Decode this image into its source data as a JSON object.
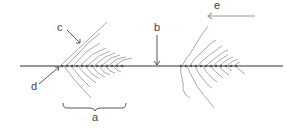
{
  "diagram": {
    "labels": {
      "a": "a",
      "b": "b",
      "c": "c",
      "d": "d",
      "e": "e"
    },
    "colors": {
      "axis": "#333333",
      "waves": "#a0a0a0",
      "arrows": "#444444",
      "direction_arrow": "#999999",
      "background": "#ffffff"
    },
    "components": [
      {
        "id": "a",
        "description": "brace spanning left wake region along the line"
      },
      {
        "id": "b",
        "description": "downward arrow pointing to the horizontal line"
      },
      {
        "id": "c",
        "description": "arrow pointing to leading upper wave front of left wake"
      },
      {
        "id": "d",
        "description": "arrow pointing to apex of left wake on the line"
      },
      {
        "id": "e",
        "description": "leftward arrow indicating direction of motion"
      }
    ]
  }
}
